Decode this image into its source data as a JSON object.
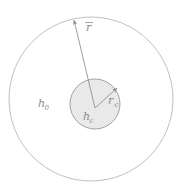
{
  "figure": {
    "name": "concentric-circles-radius-diagram",
    "background_color": "#ffffff",
    "outer_circle": {
      "label": "h",
      "label_subscript": "0",
      "label_full": "h₀",
      "cx": 91,
      "cy": 99,
      "r": 82,
      "stroke_color": "#b9b9b9",
      "fill_color": "#ffffff",
      "stroke_width": 0.9,
      "label_x": 38,
      "label_y": 107
    },
    "inner_circle": {
      "label": "h",
      "label_subscript": "c",
      "label_full": "hᶜ",
      "cx": 95,
      "cy": 104,
      "r": 25,
      "stroke_color": "#9a9a9a",
      "fill_color": "#e9e9e9",
      "stroke_width": 0.9,
      "label_x": 83,
      "label_y": 120
    },
    "arrows": [
      {
        "name": "outer-radius-arrow",
        "label": "r",
        "label_accent": "overbar",
        "label_full": "r̄",
        "x1": 95,
        "y1": 108,
        "x2": 74,
        "y2": 20,
        "label_x": 86,
        "label_y": 31,
        "color": "#8d8d8d"
      },
      {
        "name": "core-radius-arrow",
        "label": "r",
        "label_subscript": "c",
        "label_full": "rᶜ",
        "x1": 95,
        "y1": 108,
        "x2": 117,
        "y2": 88,
        "label_x": 108,
        "label_y": 104,
        "color": "#8d8d8d"
      }
    ],
    "colors": {
      "outer_stroke": "#b9b9b9",
      "inner_stroke": "#9a9a9a",
      "inner_fill": "#e9e9e9",
      "arrow": "#8d8d8d",
      "text": "#8d8d8d",
      "background": "#ffffff"
    }
  }
}
